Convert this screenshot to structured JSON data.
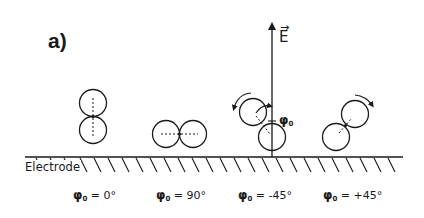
{
  "figure": {
    "panel_label": "a)",
    "electrode_label": "Electrode",
    "field_label": "E",
    "field_vector_mark": "→",
    "phi_symbol": "φ",
    "phi_subscript": "0",
    "annotation_angle_label": "φ",
    "colors": {
      "ink": "#1a1a1a",
      "background": "#ffffff"
    },
    "configurations": [
      {
        "id": "phi0-0",
        "label_value": "= 0°",
        "orientation": "vertical",
        "rotation_arrow": "none"
      },
      {
        "id": "phi0-90",
        "label_value": "= 90°",
        "orientation": "horizontal",
        "rotation_arrow": "none"
      },
      {
        "id": "phi0-minus45",
        "label_value": "= -45°",
        "orientation": "tilted-left",
        "rotation_arrow": "counterclockwise"
      },
      {
        "id": "phi0-plus45",
        "label_value": "= +45°",
        "orientation": "tilted-right",
        "rotation_arrow": "clockwise"
      }
    ]
  }
}
